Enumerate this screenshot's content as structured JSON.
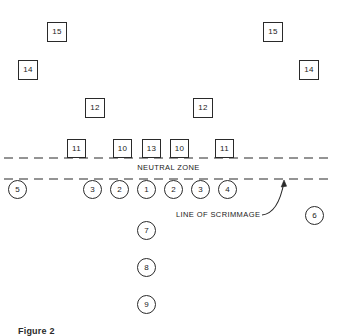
{
  "figure": {
    "caption": "Figure 2",
    "width": 337,
    "height": 336,
    "ink_color": "#2a2a2a",
    "background_color": "#ffffff"
  },
  "labels": {
    "neutral_zone": "NEUTRAL ZONE",
    "line_of_scrimmage": "LINE OF SCRIMMAGE"
  },
  "defense_squares": [
    {
      "label": "15",
      "x": 47,
      "y": 22,
      "size": 20,
      "name": "defender-15-left"
    },
    {
      "label": "15",
      "x": 263,
      "y": 22,
      "size": 20,
      "name": "defender-15-right"
    },
    {
      "label": "14",
      "x": 18,
      "y": 60,
      "size": 20,
      "name": "defender-14-left"
    },
    {
      "label": "14",
      "x": 299,
      "y": 60,
      "size": 20,
      "name": "defender-14-right"
    },
    {
      "label": "12",
      "x": 85,
      "y": 98,
      "size": 20,
      "name": "defender-12-left"
    },
    {
      "label": "12",
      "x": 193,
      "y": 98,
      "size": 20,
      "name": "defender-12-right"
    },
    {
      "label": "11",
      "x": 67,
      "y": 139,
      "size": 19,
      "name": "defender-11-left"
    },
    {
      "label": "10",
      "x": 113,
      "y": 139,
      "size": 19,
      "name": "defender-10-left"
    },
    {
      "label": "13",
      "x": 142,
      "y": 139,
      "size": 19,
      "name": "defender-13-center"
    },
    {
      "label": "10",
      "x": 170,
      "y": 139,
      "size": 19,
      "name": "defender-10-right"
    },
    {
      "label": "11",
      "x": 215,
      "y": 139,
      "size": 19,
      "name": "defender-11-right"
    }
  ],
  "offense_circles": [
    {
      "label": "5",
      "x": 8,
      "y": 180,
      "size": 19,
      "name": "offense-5-left-end"
    },
    {
      "label": "3",
      "x": 83,
      "y": 180,
      "size": 19,
      "name": "offense-3-left"
    },
    {
      "label": "2",
      "x": 110,
      "y": 180,
      "size": 19,
      "name": "offense-2-left"
    },
    {
      "label": "1",
      "x": 137,
      "y": 180,
      "size": 19,
      "name": "offense-1-center"
    },
    {
      "label": "2",
      "x": 164,
      "y": 180,
      "size": 19,
      "name": "offense-2-right"
    },
    {
      "label": "3",
      "x": 191,
      "y": 180,
      "size": 19,
      "name": "offense-3-right"
    },
    {
      "label": "4",
      "x": 218,
      "y": 180,
      "size": 19,
      "name": "offense-4-right"
    },
    {
      "label": "6",
      "x": 305,
      "y": 206,
      "size": 19,
      "name": "offense-6-right-flank"
    },
    {
      "label": "7",
      "x": 137,
      "y": 221,
      "size": 19,
      "name": "offense-7-backfield"
    },
    {
      "label": "8",
      "x": 137,
      "y": 258,
      "size": 19,
      "name": "offense-8-backfield"
    },
    {
      "label": "9",
      "x": 137,
      "y": 295,
      "size": 19,
      "name": "offense-9-backfield"
    }
  ],
  "lines": {
    "neutral_zone_top_y": 158,
    "line_of_scrimmage_y": 179,
    "x_start": 4,
    "x_end": 333,
    "dash_pattern": "9 6"
  }
}
